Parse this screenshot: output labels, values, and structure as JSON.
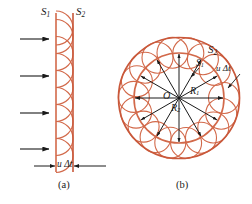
{
  "figure": {
    "colors": {
      "wavelet": "#d2694a",
      "wavefront": "#c9583a",
      "arrow": "#1a1a1a",
      "text": "#1a1a1a",
      "background": "#ffffff"
    },
    "panels": [
      {
        "id": "a",
        "caption": "(a)",
        "type": "plane-wave",
        "labels": {
          "old_wavefront": "S",
          "old_wavefront_sub": "1",
          "new_wavefront": "S",
          "new_wavefront_sub": "2",
          "distance": "u Δt"
        },
        "incoming_arrow_count": 4,
        "wavelet_count": 9
      },
      {
        "id": "b",
        "caption": "(b)",
        "type": "spherical-wave",
        "labels": {
          "center": "O",
          "radius_inner": "R",
          "radius_inner_sub": "1",
          "radius_outer": "R",
          "radius_outer_sub": "2",
          "old_wavefront": "S",
          "old_wavefront_sub": "1",
          "new_wavefront": "S",
          "new_wavefront_sub": "2",
          "distance": "u Δt"
        },
        "radial_arrow_count": 12,
        "wavelet_count": 16
      }
    ]
  }
}
